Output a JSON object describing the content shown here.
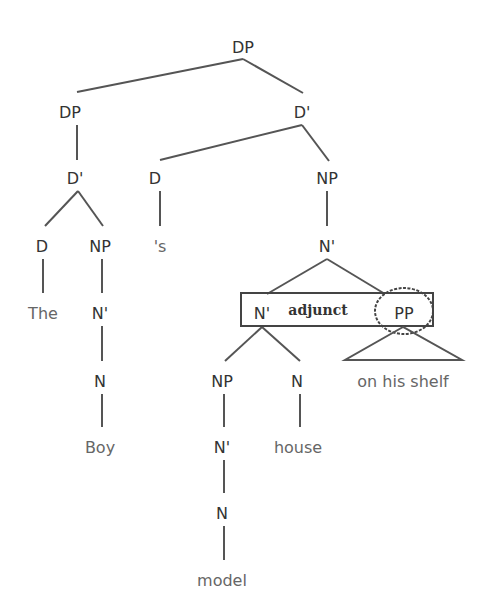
{
  "diagram": {
    "type": "syntax-tree",
    "nodes": [
      {
        "id": "dp_root",
        "label": "DP",
        "x": 243,
        "y": 47,
        "kind": "node"
      },
      {
        "id": "dp_spec",
        "label": "DP",
        "x": 70,
        "y": 112,
        "kind": "node"
      },
      {
        "id": "dbar_top",
        "label": "D'",
        "x": 302,
        "y": 112,
        "kind": "node"
      },
      {
        "id": "dbar_left",
        "label": "D'",
        "x": 75,
        "y": 178,
        "kind": "node"
      },
      {
        "id": "d_poss",
        "label": "D",
        "x": 155,
        "y": 178,
        "kind": "node"
      },
      {
        "id": "np_right",
        "label": "NP",
        "x": 327,
        "y": 178,
        "kind": "node"
      },
      {
        "id": "d_the",
        "label": "D",
        "x": 42,
        "y": 246,
        "kind": "node"
      },
      {
        "id": "np_boy",
        "label": "NP",
        "x": 100,
        "y": 246,
        "kind": "node"
      },
      {
        "id": "poss_s",
        "label": "'s",
        "x": 160,
        "y": 246,
        "kind": "word"
      },
      {
        "id": "nbar_top",
        "label": "N'",
        "x": 327,
        "y": 246,
        "kind": "node"
      },
      {
        "id": "the",
        "label": "The",
        "x": 43,
        "y": 313,
        "kind": "word"
      },
      {
        "id": "nbar_boy",
        "label": "N'",
        "x": 100,
        "y": 313,
        "kind": "node"
      },
      {
        "id": "nbar_inner",
        "label": "N'",
        "x": 262,
        "y": 313,
        "kind": "node"
      },
      {
        "id": "pp",
        "label": "PP",
        "x": 404,
        "y": 313,
        "kind": "node"
      },
      {
        "id": "n_boy",
        "label": "N",
        "x": 100,
        "y": 381,
        "kind": "node"
      },
      {
        "id": "np_model",
        "label": "NP",
        "x": 222,
        "y": 381,
        "kind": "node"
      },
      {
        "id": "n_house",
        "label": "N",
        "x": 297,
        "y": 381,
        "kind": "node"
      },
      {
        "id": "on_his_shelf",
        "label": "on his shelf",
        "x": 403,
        "y": 381,
        "kind": "word"
      },
      {
        "id": "boy",
        "label": "Boy",
        "x": 100,
        "y": 447,
        "kind": "word"
      },
      {
        "id": "nbar_model",
        "label": "N'",
        "x": 222,
        "y": 447,
        "kind": "node"
      },
      {
        "id": "house",
        "label": "house",
        "x": 298,
        "y": 447,
        "kind": "word"
      },
      {
        "id": "n_model",
        "label": "N",
        "x": 222,
        "y": 513,
        "kind": "node"
      },
      {
        "id": "model",
        "label": "model",
        "x": 222,
        "y": 580,
        "kind": "word"
      }
    ],
    "edges": [
      {
        "x1": 243,
        "y1": 59,
        "x2": 77,
        "y2": 92
      },
      {
        "x1": 243,
        "y1": 59,
        "x2": 303,
        "y2": 93
      },
      {
        "x1": 77,
        "y1": 125,
        "x2": 77,
        "y2": 160
      },
      {
        "x1": 302,
        "y1": 125,
        "x2": 160,
        "y2": 160
      },
      {
        "x1": 302,
        "y1": 125,
        "x2": 329,
        "y2": 161
      },
      {
        "x1": 78,
        "y1": 191,
        "x2": 45,
        "y2": 226
      },
      {
        "x1": 78,
        "y1": 191,
        "x2": 103,
        "y2": 226
      },
      {
        "x1": 160,
        "y1": 191,
        "x2": 160,
        "y2": 226
      },
      {
        "x1": 327,
        "y1": 191,
        "x2": 327,
        "y2": 226
      },
      {
        "x1": 43,
        "y1": 259,
        "x2": 43,
        "y2": 293
      },
      {
        "x1": 102,
        "y1": 259,
        "x2": 102,
        "y2": 293
      },
      {
        "x1": 327,
        "y1": 259,
        "x2": 267,
        "y2": 294
      },
      {
        "x1": 327,
        "y1": 259,
        "x2": 385,
        "y2": 294
      },
      {
        "x1": 102,
        "y1": 326,
        "x2": 102,
        "y2": 361
      },
      {
        "x1": 262,
        "y1": 327,
        "x2": 225,
        "y2": 361
      },
      {
        "x1": 262,
        "y1": 327,
        "x2": 300,
        "y2": 361
      },
      {
        "x1": 102,
        "y1": 394,
        "x2": 102,
        "y2": 427
      },
      {
        "x1": 224,
        "y1": 394,
        "x2": 224,
        "y2": 427
      },
      {
        "x1": 300,
        "y1": 394,
        "x2": 300,
        "y2": 427
      },
      {
        "x1": 224,
        "y1": 460,
        "x2": 224,
        "y2": 493
      },
      {
        "x1": 224,
        "y1": 526,
        "x2": 224,
        "y2": 560
      }
    ],
    "triangle": {
      "apex_x": 403,
      "apex_y": 327,
      "left_x": 345,
      "right_x": 462,
      "base_y": 360
    },
    "adjunct_box": {
      "x": 241,
      "y": 293,
      "width": 192,
      "height": 33,
      "label": "adjunct",
      "label_x": 318,
      "label_y": 315
    },
    "pp_circle": {
      "cx": 404,
      "cy": 311,
      "rx": 29,
      "ry": 23
    }
  }
}
